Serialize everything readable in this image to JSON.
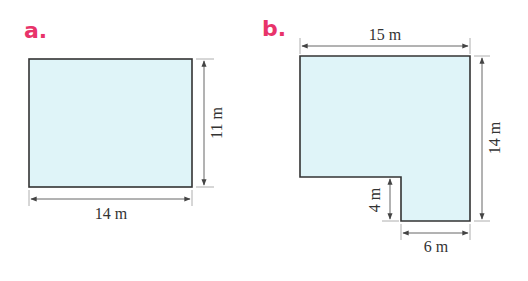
{
  "colors": {
    "label": "#e8336a",
    "fill": "#dff4f8",
    "outline": "#333333",
    "dimension_line": "#555555",
    "text": "#333333"
  },
  "figures": [
    {
      "id": "a",
      "label": "a.",
      "shape": "rectangle",
      "dimensions": {
        "width": "14 m",
        "height": "11 m"
      }
    },
    {
      "id": "b",
      "label": "b.",
      "shape": "L-shape",
      "dimensions": {
        "top": "15 m",
        "right": "14 m",
        "notch_height": "4 m",
        "bottom": "6 m"
      }
    }
  ]
}
